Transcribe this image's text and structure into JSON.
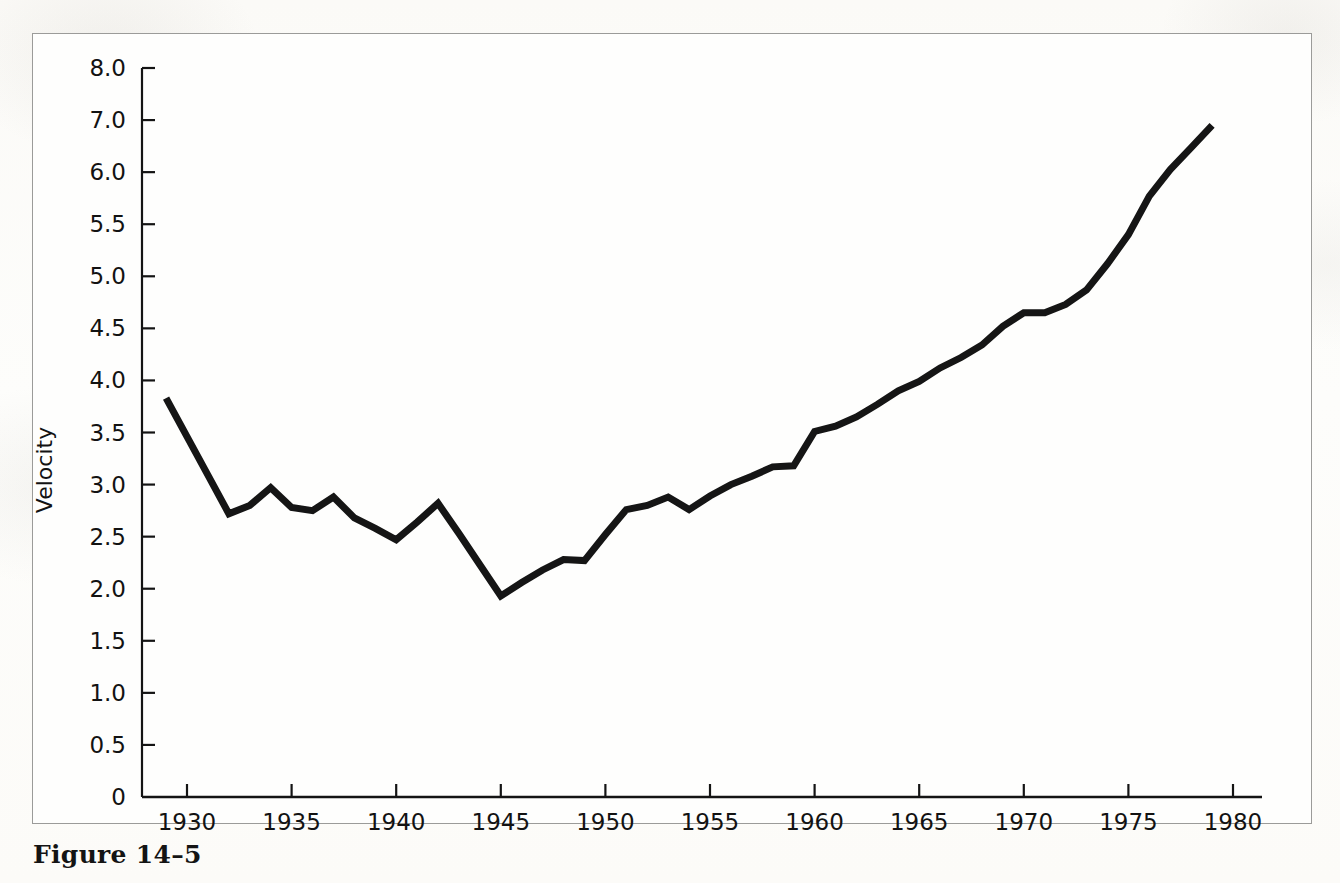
{
  "figure": {
    "caption": "Figure 14–5",
    "background_color": "#fdfcfa",
    "frame_color": "#9b9b99"
  },
  "chart_data": {
    "type": "line",
    "title": "",
    "xlabel": "",
    "ylabel": "Velocity",
    "line_color": "#151515",
    "line_width": 7,
    "grid": false,
    "legend": null,
    "xlim": [
      1929,
      1980
    ],
    "x_ticks": [
      1930,
      1935,
      1940,
      1945,
      1950,
      1955,
      1960,
      1965,
      1970,
      1975,
      1980
    ],
    "x_tick_labels": [
      "1930",
      "1935",
      "1940",
      "1945",
      "1950",
      "1955",
      "1960",
      "1965",
      "1970",
      "1975",
      "1980"
    ],
    "y_ticks": [
      0,
      0.5,
      1.0,
      1.5,
      2.0,
      2.5,
      3.0,
      3.5,
      4.0,
      4.5,
      5.0,
      5.5,
      6.0,
      7.0,
      8.0
    ],
    "y_tick_labels": [
      "0",
      "0.5",
      "1.0",
      "1.5",
      "2.0",
      "2.5",
      "3.0",
      "3.5",
      "4.0",
      "4.5",
      "5.0",
      "5.5",
      "6.0",
      "7.0",
      "8.0"
    ],
    "y_axis_note": "Tick labels are evenly spaced in pixels although the upper steps (6.0 to 7.0 to 8.0) span 1.0 while lower steps span 0.5",
    "x": [
      1929,
      1930,
      1931,
      1932,
      1933,
      1934,
      1935,
      1936,
      1937,
      1938,
      1939,
      1940,
      1941,
      1942,
      1943,
      1944,
      1945,
      1946,
      1947,
      1948,
      1949,
      1950,
      1951,
      1952,
      1953,
      1954,
      1955,
      1956,
      1957,
      1958,
      1959,
      1960,
      1961,
      1962,
      1963,
      1964,
      1965,
      1966,
      1967,
      1968,
      1969,
      1970,
      1971,
      1972,
      1973,
      1974,
      1975,
      1976,
      1977,
      1978,
      1979
    ],
    "values": [
      3.83,
      3.46,
      3.09,
      2.72,
      2.8,
      2.97,
      2.78,
      2.75,
      2.88,
      2.68,
      2.58,
      2.47,
      2.64,
      2.82,
      2.53,
      2.23,
      1.93,
      2.06,
      2.18,
      2.28,
      2.27,
      2.52,
      2.76,
      2.8,
      2.88,
      2.76,
      2.89,
      3.0,
      3.08,
      3.17,
      3.18,
      3.51,
      3.56,
      3.65,
      3.77,
      3.9,
      3.99,
      4.12,
      4.22,
      4.34,
      4.52,
      4.65,
      4.65,
      4.73,
      4.87,
      5.12,
      5.4,
      5.77,
      6.05,
      6.47,
      6.9
    ]
  }
}
